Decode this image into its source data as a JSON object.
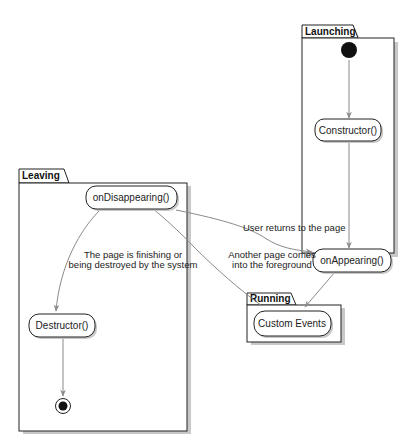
{
  "packages": {
    "launching": {
      "label": "Launching"
    },
    "leaving": {
      "label": "Leaving"
    },
    "running": {
      "label": "Running"
    }
  },
  "states": {
    "constructor": {
      "label": "Constructor()"
    },
    "on_appearing": {
      "label": "onAppearing()"
    },
    "on_disappearing": {
      "label": "onDisappearing()"
    },
    "destructor": {
      "label": "Destructor()"
    },
    "custom_events": {
      "label": "Custom Events"
    }
  },
  "edges": {
    "user_returns": {
      "label": "User returns to the page"
    },
    "another_page": {
      "line1": "Another page comes",
      "line2": "into the foreground"
    },
    "finishing": {
      "line1": "The page is finishing or",
      "line2": "being destroyed by the system"
    }
  },
  "colors": {
    "line": "#8a8a8a",
    "border": "#222222",
    "shadow": "#bdbdbd",
    "fill": "#ffffff",
    "node": "#111111"
  }
}
